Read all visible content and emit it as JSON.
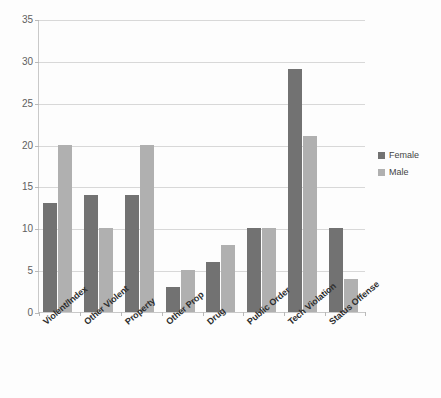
{
  "chart_data": {
    "type": "bar",
    "title": "",
    "subtitle": "",
    "xlabel": "",
    "ylabel": "",
    "ylim": [
      0,
      35
    ],
    "ytick_step": 5,
    "yticks": [
      0,
      5,
      10,
      15,
      20,
      25,
      30,
      35
    ],
    "grid": true,
    "legend_position": "right",
    "categories": [
      "Violent/Index",
      "Other Violent",
      "Property",
      "Other Prop",
      "Drug",
      "Public Order",
      "Tech Violation",
      "Status Offense"
    ],
    "series": [
      {
        "name": "Female",
        "color": "#727272",
        "values": [
          13,
          14,
          14,
          3,
          6,
          10,
          29,
          10
        ]
      },
      {
        "name": "Male",
        "color": "#b0b0b0",
        "values": [
          20,
          10,
          20,
          5,
          8,
          10,
          21,
          4
        ]
      }
    ]
  },
  "legend": {
    "items": [
      {
        "label": "Female",
        "color": "#727272"
      },
      {
        "label": "Male",
        "color": "#b0b0b0"
      }
    ]
  },
  "colors": {
    "background": "#fdfdfd",
    "gridline": "#d8d8d8",
    "axis": "#c9c9c9",
    "tick_text": "#5f5f5f",
    "category_text": "#2e2e2e"
  }
}
